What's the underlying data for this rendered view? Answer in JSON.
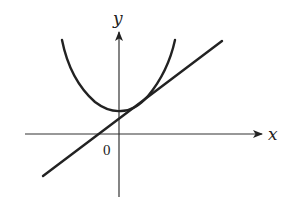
{
  "diagram": {
    "type": "function-graph",
    "axes": {
      "x_label": "x",
      "y_label": "y",
      "origin_label": "0"
    },
    "curves": [
      {
        "name": "parabola",
        "kind": "quadratic",
        "opens": "up",
        "vertex_position": "slightly right of y-axis, above x-axis"
      },
      {
        "name": "tangent-line",
        "kind": "linear",
        "slope": "positive",
        "tangent_to": "parabola"
      }
    ],
    "colors": {
      "stroke": "#222222",
      "background": "#ffffff"
    }
  }
}
